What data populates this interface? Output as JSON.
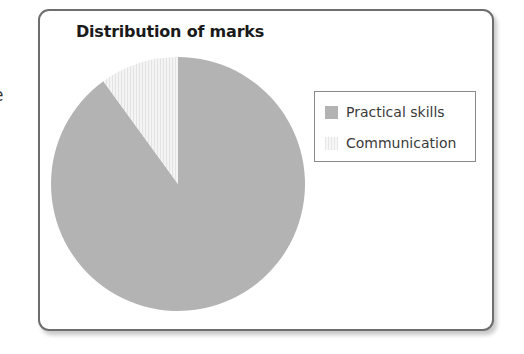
{
  "edge_fragment": "e",
  "chart_data": {
    "type": "pie",
    "title": "Distribution of marks",
    "categories": [
      "Practical skills",
      "Communication"
    ],
    "values": [
      90,
      10
    ],
    "units": "percent (estimated from slice angles)",
    "start_angle_deg": 0,
    "direction": "communication slice counter-clockwise from 12 o'clock",
    "legend_position": "right",
    "colors": [
      "#b3b3b3",
      "#f2f2f2"
    ],
    "fill_patterns": [
      "solid",
      "vertical-stripes"
    ]
  },
  "legend": {
    "items": [
      {
        "label": "Practical skills",
        "swatch": "solid-gray"
      },
      {
        "label": "Communication",
        "swatch": "vertical-stripes-light"
      }
    ]
  }
}
